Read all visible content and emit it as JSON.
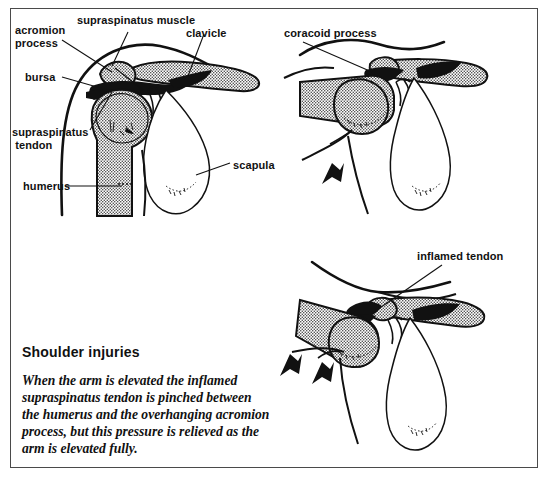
{
  "figure": {
    "background_color": "#ffffff",
    "frame_color": "#4a4a4a",
    "ink_color": "#111111",
    "bone_fill": "stipple-grey"
  },
  "panels": [
    {
      "id": "panel-arm-down",
      "position": "top-left",
      "description": "Shoulder with arm hanging down",
      "labels": [
        {
          "name": "acromion-process",
          "text": "acromion\nprocess"
        },
        {
          "name": "supraspinatus-muscle",
          "text": "supraspinatus muscle"
        },
        {
          "name": "clavicle",
          "text": "clavicle"
        },
        {
          "name": "bursa",
          "text": "bursa"
        },
        {
          "name": "supraspinatus-tendon",
          "text": "supraspinatus\n tendon"
        },
        {
          "name": "humerus",
          "text": "humerus"
        },
        {
          "name": "scapula",
          "text": "scapula"
        }
      ]
    },
    {
      "id": "panel-arm-horizontal",
      "position": "top-right",
      "description": "Shoulder with arm elevated horizontally, upward arrow",
      "labels": [
        {
          "name": "coracoid-process",
          "text": "coracoid process"
        }
      ],
      "arrows": 1
    },
    {
      "id": "panel-arm-fully-elevated",
      "position": "bottom-right",
      "description": "Shoulder with arm fully elevated, two upward arrows",
      "labels": [
        {
          "name": "inflamed-tendon",
          "text": "inflamed tendon"
        }
      ],
      "arrows": 2
    }
  ],
  "caption": {
    "title": "Shoulder injuries",
    "body": "When the arm is elevated the inflamed supraspinatus tendon is pinched between the humerus and the overhanging acromion process, but this pressure is relieved as the arm is elevated fully."
  }
}
